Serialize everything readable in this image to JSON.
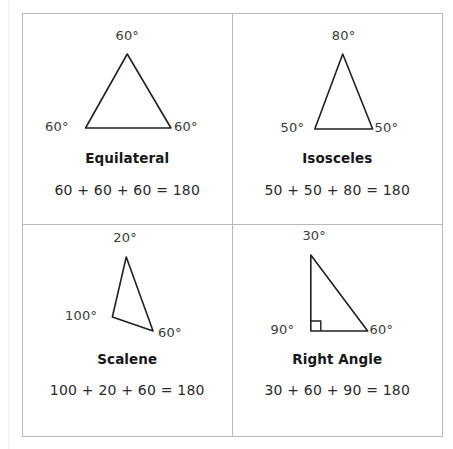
{
  "figure": {
    "line_color": "#231f20",
    "border_color": "#b9b9b9",
    "text_color": "#2a2a2e",
    "background": "#ffffff"
  },
  "cells": [
    {
      "id": "equilateral",
      "name": "Equilateral",
      "equation": "60 + 60 + 60 = 180",
      "angles": [
        {
          "key": "apex",
          "value": "60°"
        },
        {
          "key": "bottom-left",
          "value": "60°"
        },
        {
          "key": "bottom-right",
          "value": "60°"
        }
      ],
      "right_angle_marker": false
    },
    {
      "id": "isosceles",
      "name": "Isosceles",
      "equation": "50 + 50 + 80 = 180",
      "angles": [
        {
          "key": "apex",
          "value": "80°"
        },
        {
          "key": "bottom-left",
          "value": "50°"
        },
        {
          "key": "bottom-right",
          "value": "50°"
        }
      ],
      "right_angle_marker": false
    },
    {
      "id": "scalene",
      "name": "Scalene",
      "equation": "100 + 20 + 60 = 180",
      "angles": [
        {
          "key": "apex",
          "value": "20°"
        },
        {
          "key": "bottom-left",
          "value": "100°"
        },
        {
          "key": "bottom-right",
          "value": "60°"
        }
      ],
      "right_angle_marker": false
    },
    {
      "id": "right-angle",
      "name": "Right Angle",
      "equation": "30 + 60 + 90 = 180",
      "angles": [
        {
          "key": "apex",
          "value": "30°"
        },
        {
          "key": "bottom-left",
          "value": "90°"
        },
        {
          "key": "bottom-right",
          "value": "60°"
        }
      ],
      "right_angle_marker": true
    }
  ]
}
